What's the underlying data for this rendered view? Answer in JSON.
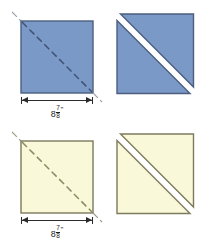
{
  "diagram": {
    "type": "quilting-cutting-diagram",
    "colors": {
      "fabric_blue": "#7b99c6",
      "fabric_blue_edge": "#4b5e7e",
      "fabric_cream": "#f9f8d8",
      "fabric_cream_edge": "#7d7a5e",
      "cut_line_blue": "#3f5378",
      "cut_line_cream": "#8d8a63",
      "dimension_line": "#2b2b2b",
      "background": "#ffffff"
    },
    "panels": [
      {
        "id": "blue-square-marked",
        "position": "top-left",
        "fabric": "blue",
        "shape": "square",
        "marking": "dashed diagonal cutting line",
        "has_dimension": true,
        "dimension": {
          "whole": "8",
          "numerator": "7",
          "denominator": "8",
          "unit": "\"",
          "text": "8 7/8\""
        }
      },
      {
        "id": "blue-square-cut",
        "position": "top-right",
        "fabric": "blue",
        "shape": "two half-square triangles",
        "marking": "cut apart along diagonal",
        "has_dimension": false
      },
      {
        "id": "cream-square-marked",
        "position": "bottom-left",
        "fabric": "cream",
        "shape": "square",
        "marking": "dashed diagonal cutting line",
        "has_dimension": true,
        "dimension": {
          "whole": "8",
          "numerator": "7",
          "denominator": "8",
          "unit": "\"",
          "text": "8 7/8\""
        }
      },
      {
        "id": "cream-square-cut",
        "position": "bottom-right",
        "fabric": "cream",
        "shape": "two half-square triangles",
        "marking": "cut apart along diagonal",
        "has_dimension": false
      }
    ]
  }
}
